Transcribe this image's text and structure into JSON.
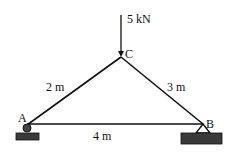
{
  "diagram": {
    "type": "truss",
    "nodes": {
      "A": {
        "label": "A",
        "support": "roller"
      },
      "B": {
        "label": "B",
        "support": "pin"
      },
      "C": {
        "label": "C"
      }
    },
    "members": [
      {
        "from": "A",
        "to": "C",
        "length_label": "2 m"
      },
      {
        "from": "C",
        "to": "B",
        "length_label": "3 m"
      },
      {
        "from": "A",
        "to": "B",
        "length_label": "4 m"
      }
    ],
    "load": {
      "node": "C",
      "label": "5 kN",
      "direction": "down"
    },
    "colors": {
      "line": "#111111",
      "support_fill": "#333333",
      "background": "#ffffff"
    }
  }
}
